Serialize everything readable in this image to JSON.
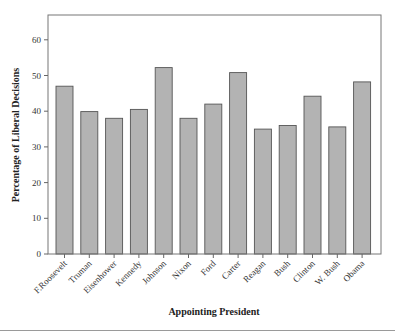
{
  "chart_data": {
    "type": "bar",
    "title": "",
    "xlabel": "Appointing President",
    "ylabel": "Percentage of Liberal Decisions",
    "categories": [
      "F.Roosevelt",
      "Truman",
      "Eisenhower",
      "Kennedy",
      "Johnson",
      "Nixon",
      "Ford",
      "Carter",
      "Reagan",
      "Bush",
      "Clinton",
      "W. Bush",
      "Obama"
    ],
    "values": [
      47.0,
      39.9,
      38.0,
      40.5,
      52.2,
      38.0,
      42.0,
      50.8,
      35.0,
      36.0,
      44.2,
      35.6,
      48.2
    ],
    "ylim": [
      0,
      67
    ],
    "yticks": [
      0,
      10,
      20,
      30,
      40,
      50,
      60
    ],
    "grid": false,
    "legend": null,
    "colors": {
      "bar_fill": "#b3b3b3",
      "bar_edge": "#555555",
      "axis": "#666666"
    }
  }
}
